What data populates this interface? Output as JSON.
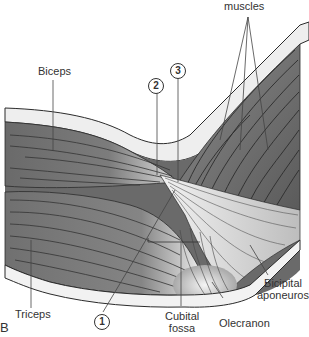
{
  "figure": {
    "panel_letter": "B",
    "colors": {
      "background": "#ffffff",
      "muscle_dark": "#5e5e5e",
      "muscle_mid": "#7a7a7a",
      "tendon_light": "#d9d9d9",
      "skin_band": "#ececec",
      "outline": "#2b2b2b",
      "leader_line": "#444444"
    },
    "labels": {
      "muscles": "muscles",
      "biceps": "Biceps",
      "triceps": "Triceps",
      "bicipital_aponeurosis_line1": "Bicipital",
      "bicipital_aponeurosis_line2": "aponeurosis",
      "cubital_fossa_line1": "Cubital",
      "cubital_fossa_line2": "fossa",
      "olecranon": "Olecranon"
    },
    "callouts": [
      {
        "id": "1",
        "label": "1"
      },
      {
        "id": "2",
        "label": "2"
      },
      {
        "id": "3",
        "label": "3"
      }
    ]
  }
}
